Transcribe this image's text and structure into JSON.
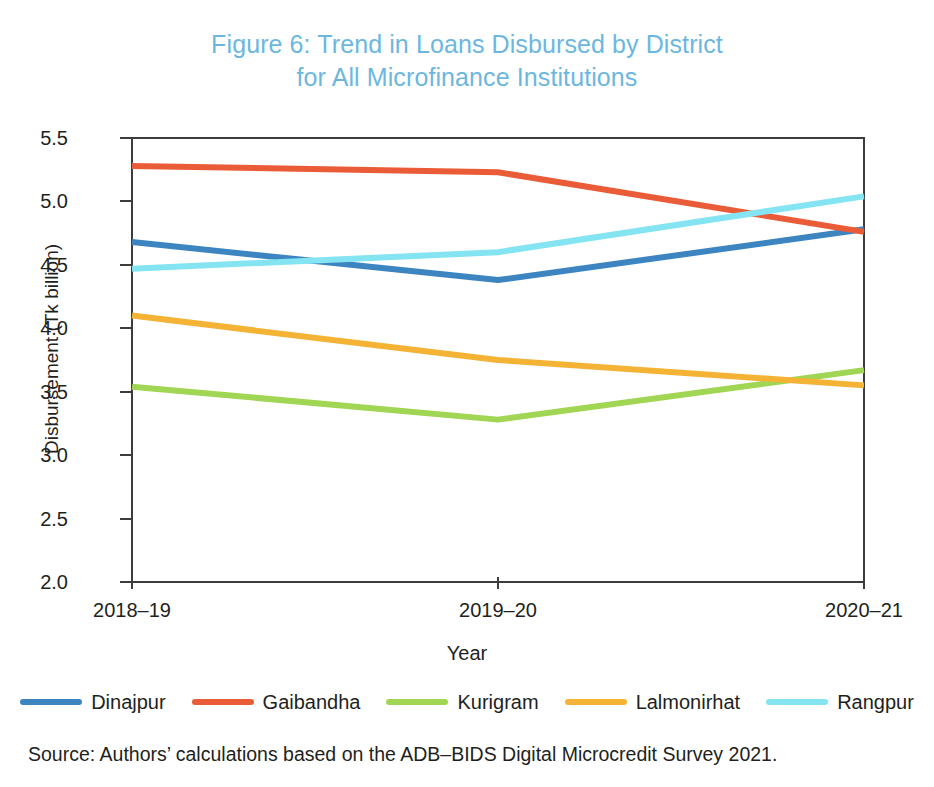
{
  "figure": {
    "title_line1": "Figure 6: Trend in Loans Disbursed by District",
    "title_line2": "for All Microfinance Institutions",
    "title_color": "#6cb7e0",
    "source_note": "Source: Authors’ calculations based on the ADB–BIDS Digital Microcredit Survey 2021."
  },
  "chart_data": {
    "type": "line",
    "title": "Figure 6: Trend in Loans Disbursed by District for All Microfinance Institutions",
    "xlabel": "Year",
    "ylabel": "Disbursement (Tk billion)",
    "categories": [
      "2018–19",
      "2019–20",
      "2020–21"
    ],
    "ylim": [
      2.0,
      5.5
    ],
    "yticks": [
      2.0,
      2.5,
      3.0,
      3.5,
      4.0,
      4.5,
      5.0,
      5.5
    ],
    "ytick_labels": [
      "2.0",
      "2.5",
      "3.0",
      "3.5",
      "4.0",
      "4.5",
      "5.0",
      "5.5"
    ],
    "grid": false,
    "legend_position": "bottom",
    "series": [
      {
        "name": "Dinajpur",
        "color": "#3d85c0",
        "values": [
          4.68,
          4.38,
          4.78
        ]
      },
      {
        "name": "Gaibandha",
        "color": "#ea5b37",
        "values": [
          5.28,
          5.23,
          4.76
        ]
      },
      {
        "name": "Kurigram",
        "color": "#a0d653",
        "values": [
          3.54,
          3.28,
          3.67
        ]
      },
      {
        "name": "Lalmonirhat",
        "color": "#f4b335",
        "values": [
          4.1,
          3.75,
          3.55
        ]
      },
      {
        "name": "Rangpur",
        "color": "#84e4f2",
        "values": [
          4.47,
          4.6,
          5.04
        ]
      }
    ]
  }
}
